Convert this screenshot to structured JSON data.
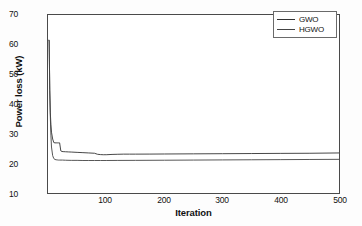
{
  "chart_data": {
    "type": "line",
    "title": "",
    "xlabel": "Iteration",
    "ylabel": "Power loss (kW)",
    "xlim": [
      0,
      500
    ],
    "ylim": [
      10,
      70
    ],
    "xticks": [
      100,
      200,
      300,
      400,
      500
    ],
    "yticks": [
      10,
      20,
      30,
      40,
      50,
      60,
      70
    ],
    "grid": false,
    "legend_position": "top-right",
    "series": [
      {
        "name": "GWO",
        "color": "#333333",
        "x": [
          1,
          2,
          3,
          4,
          5,
          6,
          8,
          10,
          12,
          14,
          16,
          18,
          20,
          22,
          24,
          26,
          30,
          35,
          40,
          50,
          60,
          70,
          80,
          85,
          90,
          95,
          100,
          110,
          120,
          130,
          140,
          150,
          175,
          200,
          250,
          300,
          350,
          400,
          450,
          500
        ],
        "y": [
          61.5,
          61.5,
          44.8,
          37.0,
          33.0,
          30.5,
          28.2,
          27.0,
          26.9,
          26.9,
          26.9,
          26.9,
          26.9,
          24.2,
          24.0,
          23.95,
          23.9,
          23.85,
          23.8,
          23.7,
          23.6,
          23.5,
          23.4,
          23.05,
          22.95,
          22.9,
          22.9,
          23.0,
          23.05,
          23.1,
          23.1,
          23.1,
          23.12,
          23.15,
          23.2,
          23.25,
          23.3,
          23.35,
          23.4,
          23.5
        ]
      },
      {
        "name": "HGWO",
        "color": "#444444",
        "x": [
          1,
          2,
          3,
          4,
          5,
          6,
          8,
          10,
          12,
          14,
          16,
          18,
          20,
          25,
          30,
          40,
          50,
          60,
          70,
          80,
          90,
          100,
          120,
          150,
          200,
          250,
          300,
          350,
          400,
          450,
          500
        ],
        "y": [
          61.5,
          61.5,
          44.5,
          35.5,
          29.5,
          25.5,
          22.6,
          21.6,
          21.3,
          21.2,
          21.15,
          21.1,
          21.1,
          21.1,
          21.05,
          21.0,
          21.0,
          20.95,
          20.95,
          20.95,
          20.95,
          20.95,
          20.98,
          21.0,
          21.05,
          21.1,
          21.15,
          21.2,
          21.25,
          21.3,
          21.35
        ]
      }
    ]
  },
  "axes": {
    "yticklabels": [
      "70",
      "60",
      "50",
      "40",
      "30",
      "20",
      "10"
    ],
    "xticklabels": [
      "100",
      "200",
      "300",
      "400",
      "500"
    ],
    "ylabel": "Power loss (kW)",
    "xlabel": "Iteration"
  },
  "legend": {
    "items": [
      {
        "label": "GWO"
      },
      {
        "label": "HGWO"
      }
    ]
  }
}
